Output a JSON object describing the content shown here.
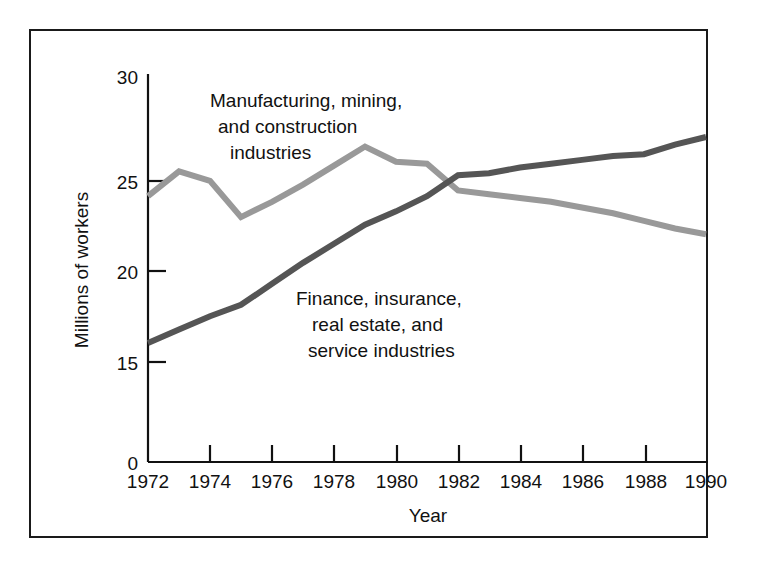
{
  "chart_data": {
    "type": "line",
    "title": "",
    "xlabel": "Year",
    "ylabel": "Millions of workers",
    "xlim": [
      1972,
      1990
    ],
    "ylim": [
      0,
      30
    ],
    "y_axis_break": true,
    "grid": false,
    "legend_position": "inline-annotations",
    "xticks": [
      1972,
      1974,
      1976,
      1978,
      1980,
      1982,
      1984,
      1986,
      1988,
      1990
    ],
    "xtick_labels": [
      "1972",
      "1974",
      "1976",
      "1978",
      "1980",
      "1982",
      "1984",
      "1986",
      "1988",
      "1990"
    ],
    "yticks": [
      0,
      15,
      20,
      25,
      30
    ],
    "ytick_labels": [
      "0",
      "15",
      "20",
      "25",
      "30"
    ],
    "x": [
      1972,
      1973,
      1974,
      1975,
      1976,
      1977,
      1978,
      1979,
      1980,
      1981,
      1982,
      1983,
      1984,
      1985,
      1986,
      1987,
      1988,
      1989,
      1990
    ],
    "series": [
      {
        "name": "Manufacturing, mining, and construction industries",
        "color": "#999999",
        "values": [
          23.7,
          25.0,
          24.5,
          22.6,
          23.4,
          24.3,
          25.3,
          26.3,
          25.5,
          25.4,
          24.0,
          23.8,
          23.6,
          23.4,
          23.1,
          22.8,
          22.4,
          22.0,
          21.7
        ]
      },
      {
        "name": "Finance, insurance, real estate, and service industries",
        "color": "#555555",
        "values": [
          16.0,
          16.7,
          17.4,
          18.0,
          19.1,
          20.2,
          21.2,
          22.2,
          22.9,
          23.7,
          24.8,
          24.9,
          25.2,
          25.4,
          25.6,
          25.8,
          25.9,
          26.4,
          26.8
        ]
      }
    ],
    "annotations": [
      {
        "name": "manufacturing-label",
        "lines": [
          "Manufacturing, mining,",
          "and construction",
          "industries"
        ],
        "series_ref": 0
      },
      {
        "name": "finance-label",
        "lines": [
          "Finance, insurance,",
          "real estate, and",
          "service industries"
        ],
        "series_ref": 1
      }
    ]
  },
  "annotation_manufacturing": {
    "line1": "Manufacturing, mining,",
    "line2": "and construction",
    "line3": "industries"
  },
  "annotation_finance": {
    "line1": "Finance, insurance,",
    "line2": "real estate, and",
    "line3": "service industries"
  },
  "axes": {
    "xlabel": "Year",
    "ylabel": "Millions of workers",
    "ytick_0": "0",
    "ytick_15": "15",
    "ytick_20": "20",
    "ytick_25": "25",
    "ytick_30": "30",
    "xtick_1972": "1972",
    "xtick_1974": "1974",
    "xtick_1976": "1976",
    "xtick_1978": "1978",
    "xtick_1980": "1980",
    "xtick_1982": "1982",
    "xtick_1984": "1984",
    "xtick_1986": "1986",
    "xtick_1988": "1988",
    "xtick_1990": "1990"
  },
  "colors": {
    "series_manufacturing": "#999999",
    "series_finance": "#555555",
    "axis": "#111111",
    "frame": "#1a1a1a",
    "background": "#ffffff"
  }
}
